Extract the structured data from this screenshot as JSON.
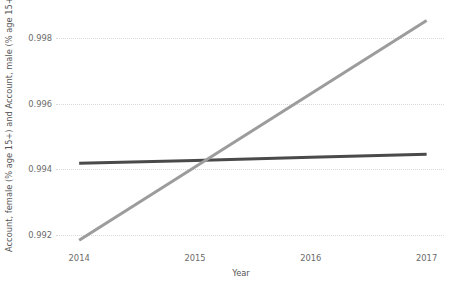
{
  "chart_data": {
    "type": "line",
    "title": "",
    "xlabel": "Year",
    "ylabel": "Account, female (% age 15+) and Account, male (% age 15+)",
    "x": [
      2014,
      2015,
      2016,
      2017
    ],
    "xlim": [
      2013.8,
      2017.15
    ],
    "ylim": [
      0.99155,
      0.99885
    ],
    "xticks": [
      "2014",
      "2015",
      "2016",
      "2017"
    ],
    "yticks": [
      "0.992",
      "0.994",
      "0.996",
      "0.998"
    ],
    "ytick_values": [
      0.992,
      0.994,
      0.996,
      0.998
    ],
    "xtick_values": [
      2014,
      2015,
      2016,
      2017
    ],
    "grid": "horizontal-dotted",
    "legend": "none",
    "series": [
      {
        "name": "Account, female (% age 15+)",
        "color": "#4a4a4a",
        "values": [
          0.994185,
          0.994275,
          0.99437,
          0.99446
        ]
      },
      {
        "name": "Account, male (% age 15+)",
        "color": "#9c9c9c",
        "values": [
          0.991845,
          0.994075,
          0.9963,
          0.99853
        ]
      }
    ],
    "colors": {
      "grid": "#d9d9d9",
      "text": "#6b6b6b",
      "axis_label": "#555555",
      "background": "#ffffff"
    }
  }
}
